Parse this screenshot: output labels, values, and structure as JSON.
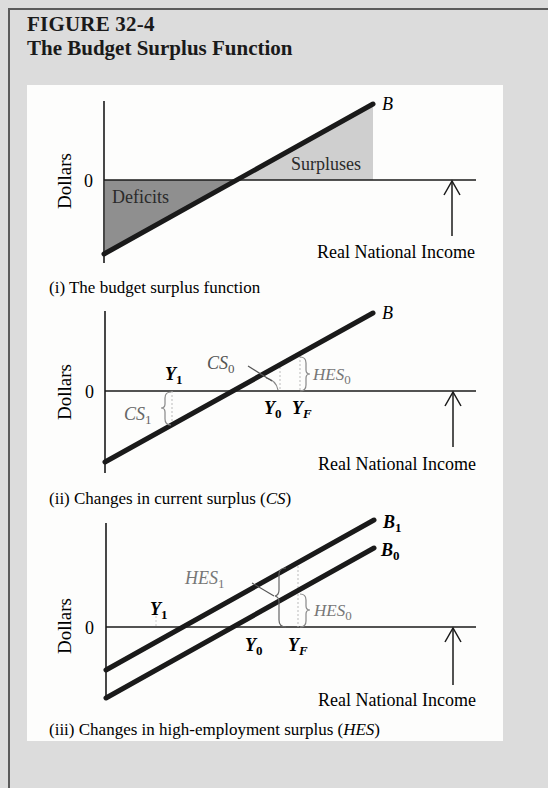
{
  "figure": {
    "number": "FIGURE 32-4",
    "title": "The Budget Surplus Function"
  },
  "panels": [
    {
      "id": "i",
      "caption": "(i)  The budget surplus function",
      "ylabel": "Dollars",
      "zero_label": "0",
      "xlabel": "Real National Income",
      "line_label": "B",
      "regions": {
        "deficit": "Deficits",
        "surplus": "Surpluses"
      }
    },
    {
      "id": "ii",
      "caption_prefix": "(ii)  Changes in current surplus (",
      "caption_em": "CS",
      "caption_suffix": ")",
      "ylabel": "Dollars",
      "zero_label": "0",
      "xlabel": "Real National Income",
      "line_label": "B",
      "labels": {
        "y1": "Y",
        "y1_sub": "1",
        "y0": "Y",
        "y0_sub": "0",
        "yf": "Y",
        "yf_sub": "F",
        "cs0": "CS",
        "cs0_sub": "0",
        "cs1": "CS",
        "cs1_sub": "1",
        "hes0": "HES",
        "hes0_sub": "0"
      }
    },
    {
      "id": "iii",
      "caption_prefix": "(iii)  Changes in high-employment surplus (",
      "caption_em": "HES",
      "caption_suffix": ")",
      "ylabel": "Dollars",
      "zero_label": "0",
      "xlabel": "Real National Income",
      "line_labels": {
        "b1": "B",
        "b1_sub": "1",
        "b0": "B",
        "b0_sub": "0"
      },
      "labels": {
        "y1": "Y",
        "y1_sub": "1",
        "y0": "Y",
        "y0_sub": "0",
        "yf": "Y",
        "yf_sub": "F",
        "hes1": "HES",
        "hes1_sub": "1",
        "hes0": "HES",
        "hes0_sub": "0"
      }
    }
  ],
  "colors": {
    "background": "#dcdcdc",
    "panel": "#fdfdfc",
    "line": "#1a1a1a",
    "deficit_fill": "#8f8f8f",
    "surplus_fill": "#cfcfcf",
    "annotation_gray": "#7a7a7a"
  }
}
